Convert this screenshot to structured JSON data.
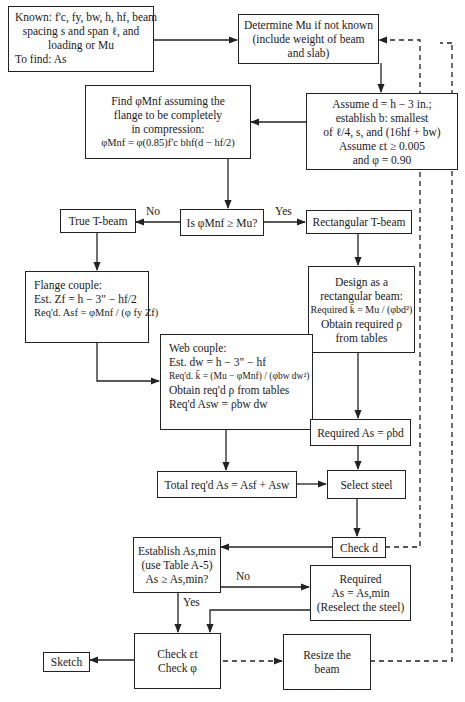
{
  "diagram": {
    "type": "flowchart",
    "nodes": {
      "known": {
        "line1": "Known: f'c, fy, bw, h, hf, beam",
        "line2": "spacing s and span ℓ, and",
        "line3": "loading or Mu",
        "line4": "To find: As"
      },
      "determine": {
        "line1": "Determine Mu if not known",
        "line2": "(include weight of beam",
        "line3": "and slab)"
      },
      "find_phi_mnf": {
        "line1": "Find φMnf assuming the",
        "line2": "flange to be completely",
        "line3": "in compression:",
        "formula": "φMnf = φ(0.85)f'c bhf(d − hf/2)"
      },
      "assume_d": {
        "line1": "Assume d = h − 3 in.;",
        "line2": "establish b: smallest",
        "line3": "of ℓ/4, s, and (16hf + bw)",
        "line4": "Assume εt ≥ 0.005",
        "line5": "and φ = 0.90"
      },
      "decision_mnf": {
        "text": "Is φMnf ≥ Mu?"
      },
      "true_tbeam": {
        "text": "True T-beam"
      },
      "rect_tbeam": {
        "text": "Rectangular T-beam"
      },
      "flange_couple": {
        "line1": "Flange couple:",
        "line2": "Est. Zf = h − 3\" − hf/2",
        "line3": "Req'd. Asf = φMnf / (φ fy Zf)"
      },
      "design_rect": {
        "line1": "Design as a",
        "line2": "rectangular beam:",
        "line3": "Required k̄ = Mu / (φbd²)",
        "line4": "Obtain required ρ",
        "line5": "from tables"
      },
      "web_couple": {
        "line1": "Web couple:",
        "line2": "Est. dw = h − 3\" − hf",
        "line3": "Req'd. k̄ = (Mu − φMnf) / (φbw dw²)",
        "line4": "Obtain req'd ρ from tables",
        "line5": "Req'd Asw = ρbw dw"
      },
      "required_as_rho": {
        "text": "Required As = ρbd"
      },
      "total_as": {
        "text": "Total req'd As = Asf + Asw"
      },
      "select_steel": {
        "text": "Select steel"
      },
      "check_d": {
        "text": "Check d"
      },
      "establish_asmin": {
        "line1": "Establish As,min",
        "line2": "(use Table A-5)",
        "line3": "As ≥ As,min?"
      },
      "required_asmin": {
        "line1": "Required",
        "line2": "As = As,min",
        "line3": "(Reselect the steel)"
      },
      "check_et": {
        "line1": "Check εt",
        "line2": "Check φ"
      },
      "sketch": {
        "text": "Sketch"
      },
      "resize": {
        "line1": "Resize the",
        "line2": "beam"
      }
    },
    "edge_labels": {
      "no_mnf": "No",
      "yes_mnf": "Yes",
      "no_asmin": "No",
      "yes_asmin": "Yes"
    },
    "colors": {
      "line": "#222222",
      "background": "#ffffff",
      "text": "#1a1a1a"
    }
  }
}
